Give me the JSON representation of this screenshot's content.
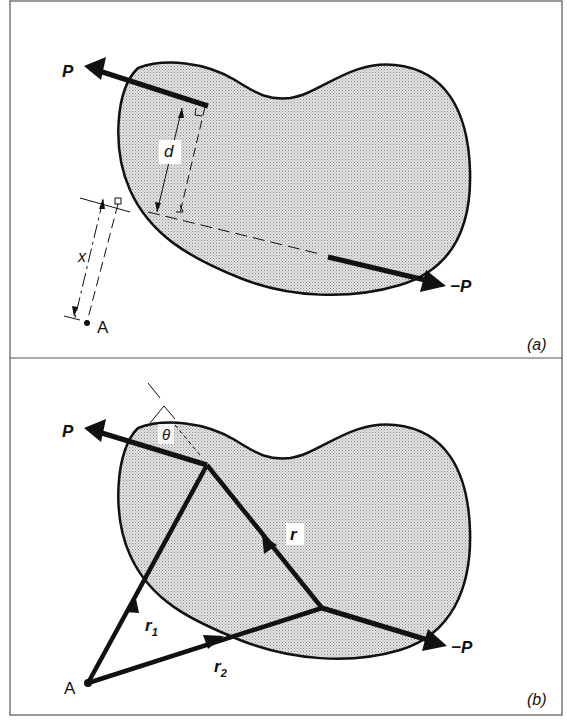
{
  "figure": {
    "panels": [
      {
        "id": "a",
        "caption": "(a)",
        "labels": {
          "force": "P",
          "neg_force": "−P",
          "distance_d": "d",
          "distance_x": "x",
          "point": "A"
        }
      },
      {
        "id": "b",
        "caption": "(b)",
        "labels": {
          "force": "P",
          "neg_force": "−P",
          "vector_r": "r",
          "vector_r1": "r",
          "vector_r1_sub": "1",
          "vector_r2": "r",
          "vector_r2_sub": "2",
          "angle": "θ",
          "point": "A"
        }
      }
    ],
    "colors": {
      "ink": "#111111",
      "fill": "#d9d9d9",
      "border": "#555555",
      "background": "#ffffff"
    }
  }
}
